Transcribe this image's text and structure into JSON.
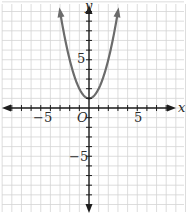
{
  "chart_data": {
    "type": "line",
    "title": "",
    "xlabel": "x",
    "ylabel": "y",
    "origin_label": "O",
    "xlim": [
      -9,
      10
    ],
    "ylim": [
      -10,
      11
    ],
    "grid": true,
    "legend": null,
    "x_tick_labels": [
      {
        "value": -5,
        "label": "−5"
      },
      {
        "value": 5,
        "label": "5"
      }
    ],
    "y_tick_labels": [
      {
        "value": 5,
        "label": "5"
      },
      {
        "value": -5,
        "label": "−5"
      }
    ],
    "series": [
      {
        "name": "y = x^2 + 1",
        "equation": "y = x^2 + 1",
        "vertex": [
          0,
          1
        ],
        "x": [
          -3,
          -2.5,
          -2,
          -1.5,
          -1,
          -0.5,
          0,
          0.5,
          1,
          1.5,
          2,
          2.5,
          3
        ],
        "values": [
          10,
          7.25,
          5,
          3.25,
          2,
          1.25,
          1,
          1.25,
          2,
          3.25,
          5,
          7.25,
          10
        ],
        "arrows_at_ends": true,
        "color": "#6b6b6b"
      }
    ]
  },
  "colors": {
    "grid": "#d4d4d4",
    "axis": "#1e1e1e",
    "curve": "#6b6b6b"
  }
}
